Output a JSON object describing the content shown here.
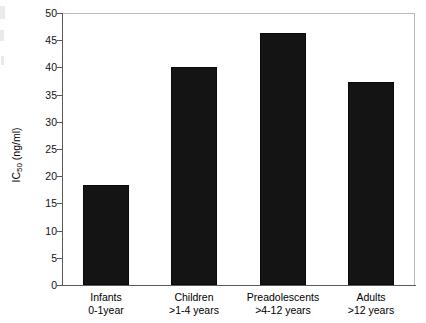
{
  "chart_data": {
    "type": "bar",
    "title": "",
    "xlabel": "",
    "ylabel": "IC50 (ng/ml)",
    "ylabel_base": "IC",
    "ylabel_sub": "50",
    "ylabel_unit": " (ng/ml)",
    "ylim": [
      0,
      50
    ],
    "ytick_values": [
      50,
      45,
      40,
      35,
      30,
      25,
      20,
      15,
      10,
      5,
      0
    ],
    "ytick_labels": [
      "50",
      "45",
      "40",
      "35",
      "30",
      "25",
      "20",
      "15",
      "10",
      "5",
      "0"
    ],
    "grid": false,
    "legend": null,
    "bar_color": "#141414",
    "axis_color": "#5a5a5a",
    "frame_color": "#b9b9b9",
    "categories": [
      "Infants 0-1year",
      "Children >1-4 years",
      "Preadolescents >4-12 years",
      "Adults >12 years"
    ],
    "category_lines": [
      {
        "line1": "Infants",
        "line2": "0-1year"
      },
      {
        "line1": "Children",
        "line2": ">1-4 years"
      },
      {
        "line1": "Preadolescents",
        "line2": ">4-12 years"
      },
      {
        "line1": "Adults",
        "line2": ">12 years"
      }
    ],
    "values": [
      18.3,
      40.0,
      46.3,
      37.3
    ]
  }
}
